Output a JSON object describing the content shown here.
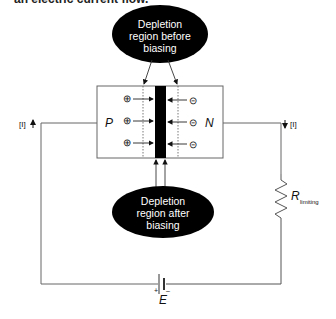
{
  "caption_fragment": "an electric current flow.",
  "top_bubble": {
    "lines": [
      "Depletion",
      "region before",
      "biasing"
    ]
  },
  "bottom_bubble": {
    "lines": [
      "Depletion",
      "region after",
      "biasing"
    ]
  },
  "p_label": "P",
  "n_label": "N",
  "left_current": "[I]",
  "right_current": "[I]",
  "resistor": {
    "symbol": "R",
    "subscript": "limiting"
  },
  "battery": {
    "label": "E",
    "plus": "+",
    "minus": "–"
  },
  "carriers": {
    "p_side": [
      "⊕",
      "⊕",
      "⊕"
    ],
    "n_side": [
      "⊝",
      "⊝",
      "⊝"
    ]
  },
  "colors": {
    "line": "#555555",
    "ink": "#111111",
    "bubble": "#000000"
  }
}
